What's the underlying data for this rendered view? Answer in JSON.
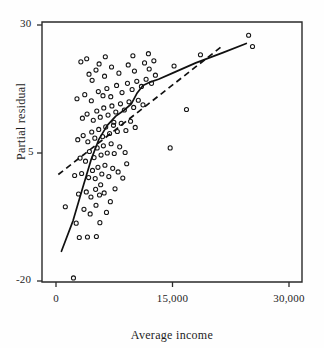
{
  "chart_data": {
    "type": "scatter",
    "title": "",
    "xlabel": "Average income",
    "ylabel": "Partial residual",
    "xlim": [
      -2000,
      31500
    ],
    "ylim": [
      -23,
      33
    ],
    "xticks": [
      0,
      15000,
      30000
    ],
    "xticklabels": [
      "0",
      "15,000",
      "30,000"
    ],
    "yticks": [
      30,
      5,
      -20
    ],
    "yticklabels": [
      "30",
      "5",
      "-20"
    ],
    "grid": false,
    "legend": null,
    "marker": "open-circle",
    "point_color": "#151515",
    "line_color": "#101010",
    "points": [
      [
        2250,
        -19.4
      ],
      [
        1200,
        -5.5
      ],
      [
        2600,
        -8.7
      ],
      [
        3000,
        -11.5
      ],
      [
        4050,
        -11.4
      ],
      [
        5200,
        -11.3
      ],
      [
        5650,
        -8.6
      ],
      [
        3600,
        -6.0
      ],
      [
        4400,
        -6.9
      ],
      [
        5150,
        -5.2
      ],
      [
        6500,
        -6.6
      ],
      [
        2900,
        -3.0
      ],
      [
        3900,
        -2.6
      ],
      [
        4500,
        -3.6
      ],
      [
        5100,
        -2.1
      ],
      [
        5600,
        -3.2
      ],
      [
        5750,
        -1.2
      ],
      [
        6200,
        -2.8
      ],
      [
        7000,
        -4.5
      ],
      [
        7600,
        -2.0
      ],
      [
        2400,
        0.6
      ],
      [
        3300,
        1.0
      ],
      [
        4200,
        0.2
      ],
      [
        4700,
        1.6
      ],
      [
        5050,
        0.0
      ],
      [
        5400,
        2.2
      ],
      [
        5900,
        0.9
      ],
      [
        6300,
        2.6
      ],
      [
        6800,
        0.4
      ],
      [
        7300,
        2.0
      ],
      [
        8000,
        1.3
      ],
      [
        8600,
        0.1
      ],
      [
        9100,
        2.9
      ],
      [
        3100,
        4.0
      ],
      [
        3800,
        3.4
      ],
      [
        4300,
        5.3
      ],
      [
        4900,
        4.1
      ],
      [
        5300,
        6.0
      ],
      [
        5800,
        4.6
      ],
      [
        6100,
        6.4
      ],
      [
        6600,
        5.0
      ],
      [
        7100,
        6.8
      ],
      [
        7500,
        4.9
      ],
      [
        8200,
        6.2
      ],
      [
        8900,
        5.1
      ],
      [
        2800,
        7.6
      ],
      [
        3500,
        8.4
      ],
      [
        4100,
        7.2
      ],
      [
        4600,
        9.1
      ],
      [
        5000,
        7.9
      ],
      [
        5500,
        9.6
      ],
      [
        6000,
        8.2
      ],
      [
        6400,
        10.1
      ],
      [
        6900,
        8.8
      ],
      [
        7400,
        10.4
      ],
      [
        7900,
        9.2
      ],
      [
        8400,
        10.8
      ],
      [
        9000,
        9.4
      ],
      [
        9600,
        11.2
      ],
      [
        10200,
        10.0
      ],
      [
        3400,
        11.8
      ],
      [
        4000,
        12.6
      ],
      [
        4800,
        11.4
      ],
      [
        5250,
        13.2
      ],
      [
        5700,
        12.0
      ],
      [
        6150,
        13.8
      ],
      [
        6700,
        12.4
      ],
      [
        7200,
        14.2
      ],
      [
        7700,
        13.0
      ],
      [
        8300,
        14.6
      ],
      [
        8800,
        13.4
      ],
      [
        9400,
        15.0
      ],
      [
        10000,
        13.9
      ],
      [
        10600,
        15.3
      ],
      [
        11200,
        14.4
      ],
      [
        2700,
        15.6
      ],
      [
        3700,
        16.4
      ],
      [
        4550,
        15.2
      ],
      [
        5450,
        17.0
      ],
      [
        6050,
        16.2
      ],
      [
        6550,
        17.6
      ],
      [
        7050,
        16.0
      ],
      [
        7800,
        18.2
      ],
      [
        8500,
        16.8
      ],
      [
        9200,
        18.6
      ],
      [
        9800,
        17.4
      ],
      [
        10400,
        19.0
      ],
      [
        11000,
        18.0
      ],
      [
        11600,
        19.4
      ],
      [
        12300,
        18.6
      ],
      [
        4250,
        20.4
      ],
      [
        5150,
        21.2
      ],
      [
        6250,
        20.0
      ],
      [
        7150,
        21.8
      ],
      [
        8100,
        20.6
      ],
      [
        9300,
        22.2
      ],
      [
        10100,
        21.0
      ],
      [
        11400,
        22.6
      ],
      [
        12000,
        21.4
      ],
      [
        12800,
        20.2
      ],
      [
        3200,
        22.8
      ],
      [
        3950,
        23.4
      ],
      [
        5550,
        22.4
      ],
      [
        6350,
        23.8
      ],
      [
        9900,
        24.0
      ],
      [
        11900,
        24.4
      ],
      [
        12600,
        23.0
      ],
      [
        14700,
        6.0
      ],
      [
        16800,
        13.5
      ],
      [
        15200,
        22.0
      ],
      [
        18600,
        24.2
      ],
      [
        24800,
        28.0
      ],
      [
        25300,
        25.8
      ],
      [
        4650,
        19.2
      ],
      [
        7450,
        11.0
      ]
    ],
    "lowess_curve": [
      [
        700,
        -14.2
      ],
      [
        2200,
        -8.2
      ],
      [
        3400,
        -2.0
      ],
      [
        4500,
        3.6
      ],
      [
        5500,
        7.6
      ],
      [
        6600,
        10.4
      ],
      [
        7700,
        12.2
      ],
      [
        8800,
        13.4
      ],
      [
        9700,
        14.6
      ],
      [
        10400,
        16.6
      ],
      [
        11200,
        18.2
      ],
      [
        12200,
        18.9
      ],
      [
        13200,
        19.4
      ],
      [
        15000,
        20.6
      ],
      [
        18000,
        22.6
      ],
      [
        21500,
        24.6
      ],
      [
        24500,
        26.4
      ]
    ],
    "regression_line": {
      "x": [
        300,
        21500
      ],
      "y": [
        0.8,
        26.0
      ],
      "style": "dashed"
    }
  },
  "axes": {
    "frame": {
      "left": 42,
      "top": 22,
      "right": 302,
      "bottom": 282
    }
  }
}
